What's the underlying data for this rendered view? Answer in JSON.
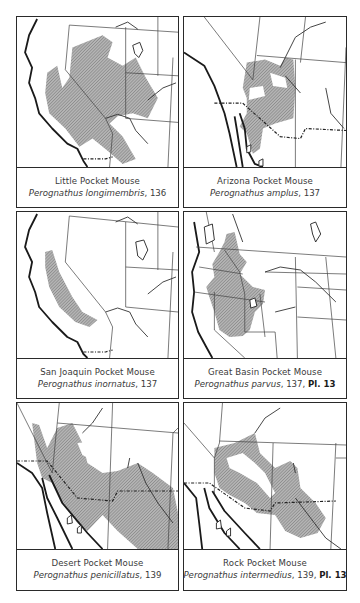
{
  "page": {
    "hatch_color": "#9a9a9a",
    "line_color": "#2a2a2a"
  },
  "panels": [
    {
      "id": "little-pocket-mouse",
      "common_name": "Little Pocket Mouse",
      "scientific_name": "Perognathus longimembris",
      "page_ref": ", 136",
      "plate": ""
    },
    {
      "id": "arizona-pocket-mouse",
      "common_name": "Arizona Pocket Mouse",
      "scientific_name": "Perognathus amplus",
      "page_ref": ", 137",
      "plate": ""
    },
    {
      "id": "san-joaquin-pocket-mouse",
      "common_name": "San Joaquin Pocket Mouse",
      "scientific_name": "Perognathus inornatus",
      "page_ref": ", 137",
      "plate": ""
    },
    {
      "id": "great-basin-pocket-mouse",
      "common_name": "Great Basin Pocket Mouse",
      "scientific_name": "Perognathus parvus",
      "page_ref": ", 137, ",
      "plate": "Pl. 13"
    },
    {
      "id": "desert-pocket-mouse",
      "common_name": "Desert Pocket Mouse",
      "scientific_name": "Perognathus penicillatus",
      "page_ref": ", 139",
      "plate": ""
    },
    {
      "id": "rock-pocket-mouse",
      "common_name": "Rock Pocket Mouse",
      "scientific_name": "Perognathus intermedius",
      "page_ref": ", 139, ",
      "plate": "Pl. 13"
    }
  ]
}
